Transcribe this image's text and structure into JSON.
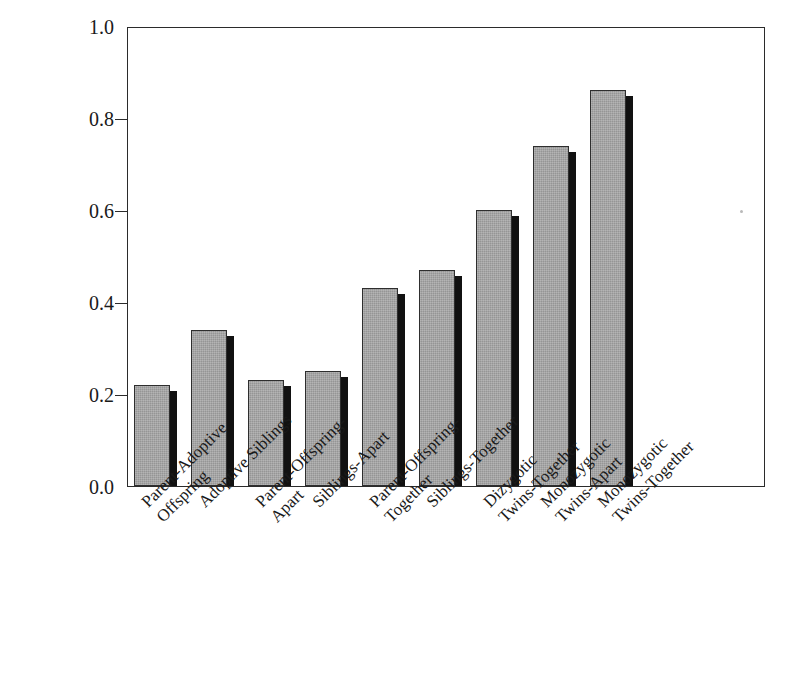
{
  "chart_data": {
    "type": "bar",
    "title": "",
    "xlabel": "",
    "ylabel": "Correlations",
    "ylim": [
      0.0,
      1.0
    ],
    "yticks": [
      "1.0",
      "0.8",
      "0.6",
      "0.4",
      "0.2",
      "0.0"
    ],
    "ytick_values": [
      1.0,
      0.8,
      0.6,
      0.4,
      0.2,
      0.0
    ],
    "grid": false,
    "legend": "none",
    "categories": [
      "Parent-Adoptive\nOffspring",
      "Adoptive Siblings",
      "Parent-Offspring-\nApart",
      "Siblings-Apart",
      "Parent-Offspring-\nTogether",
      "Siblings-Together",
      "Dizygotic\nTwins-Together",
      "Monozygotic\nTwins-Apart",
      "Monozygotic\nTwins-Together"
    ],
    "categories_lines": [
      [
        "Parent-Adoptive",
        "Offspring"
      ],
      [
        "Adoptive Siblings"
      ],
      [
        "Parent-Offspring-",
        "Apart"
      ],
      [
        "Siblings-Apart"
      ],
      [
        "Parent-Offspring-",
        "Together"
      ],
      [
        "Siblings-Together"
      ],
      [
        "Dizygotic",
        "Twins-Together"
      ],
      [
        "Monozygotic",
        "Twins-Apart"
      ],
      [
        "Monozygotic",
        "Twins-Together"
      ]
    ],
    "values": [
      0.22,
      0.34,
      0.23,
      0.25,
      0.43,
      0.47,
      0.6,
      0.74,
      0.86
    ],
    "bar_fill_color": "#a3a3a3",
    "bar_edge_color": "#2e2e2e",
    "bar_shadow_color": "#111111",
    "axis_color": "#2b2b2b",
    "background_color": "#ffffff"
  }
}
